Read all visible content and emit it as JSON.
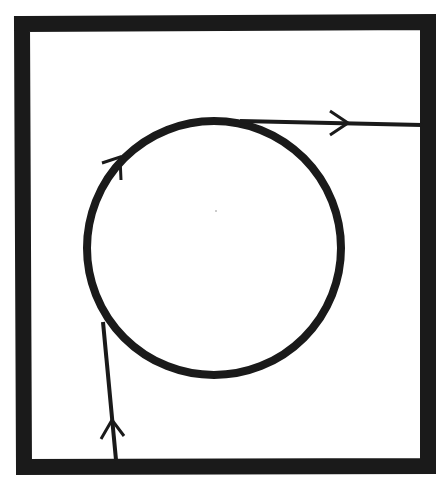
{
  "diagram": {
    "elements": {
      "frame": "rectangular-boundary",
      "circle": "circular-loop",
      "entry_path": "incoming-line",
      "exit_path": "outgoing-line"
    },
    "arrows": [
      {
        "name": "entry-arrow",
        "direction": "up"
      },
      {
        "name": "loop-arrow",
        "direction": "up-right"
      },
      {
        "name": "exit-arrow",
        "direction": "right"
      }
    ],
    "colors": {
      "ink": "#1a1a1a",
      "background": "#ffffff"
    }
  }
}
